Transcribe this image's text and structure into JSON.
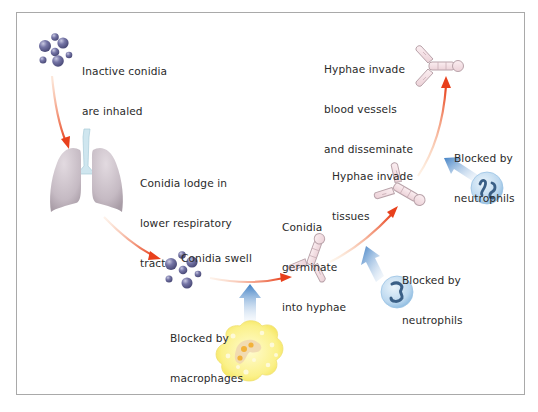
{
  "diagram": {
    "colors": {
      "frame": "#a9a9a9",
      "progression_arrow": "#e8401c",
      "blocking_arrow": "#3f7fc4",
      "conidia": "#6a6a98",
      "lung": "#c9bfc6",
      "trachea": "#cfe6ef",
      "hyphae": "#f2dde2",
      "neutrophil": "#cfe3f3",
      "macrophage": "#f8ee86"
    },
    "stages": [
      {
        "id": "inhaled",
        "label_lines": [
          "Inactive conidia",
          "are inhaled"
        ],
        "icon": "conidia-cluster-icon"
      },
      {
        "id": "lodge",
        "label_lines": [
          "Conidia lodge in",
          "lower respiratory",
          "tract"
        ],
        "icon": "lungs-icon"
      },
      {
        "id": "swell",
        "label_lines": [
          "Conidia swell"
        ],
        "icon": "swollen-conidia-icon"
      },
      {
        "id": "germinate",
        "label_lines": [
          "Conidia",
          "germinate",
          "into hyphae"
        ],
        "icon": "hypha-icon"
      },
      {
        "id": "invade_tissues",
        "label_lines": [
          "Hyphae invade",
          "tissues"
        ],
        "icon": "hypha-icon"
      },
      {
        "id": "invade_vessels",
        "label_lines": [
          "Hyphae invade",
          "blood vessels",
          "and disseminate"
        ],
        "icon": "hypha-icon"
      }
    ],
    "defenses": [
      {
        "id": "macrophages",
        "label_lines": [
          "Blocked by",
          "macrophages"
        ],
        "icon": "macrophage-icon",
        "blocks": "swell"
      },
      {
        "id": "neutrophils_1",
        "label_lines": [
          "Blocked by",
          "neutrophils"
        ],
        "icon": "neutrophil-icon",
        "blocks": "germinate"
      },
      {
        "id": "neutrophils_2",
        "label_lines": [
          "Blocked by",
          "neutrophils"
        ],
        "icon": "neutrophil-icon",
        "blocks": "invade_tissues"
      }
    ]
  }
}
